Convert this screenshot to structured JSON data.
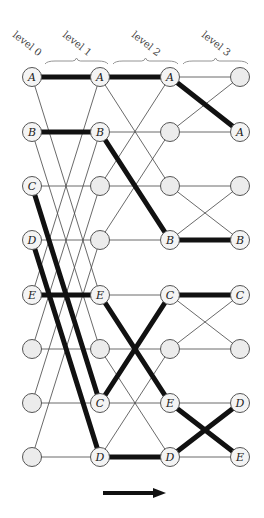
{
  "diagram": {
    "type": "butterfly-network",
    "levels": [
      {
        "label": "level 0",
        "x": 32
      },
      {
        "label": "level 1",
        "x": 100
      },
      {
        "label": "level 2",
        "x": 170
      },
      {
        "label": "level 3",
        "x": 240
      }
    ],
    "rows_y": [
      77,
      132,
      186,
      240,
      295,
      349,
      403,
      457
    ],
    "strides": [
      4,
      2,
      1
    ],
    "node_labels": [
      [
        "A",
        "B",
        "C",
        "D",
        "E",
        "",
        "",
        ""
      ],
      [
        "A",
        "B",
        "",
        "",
        "E",
        "",
        "C",
        "D"
      ],
      [
        "A",
        "",
        "",
        "B",
        "C",
        "",
        "E",
        "D"
      ],
      [
        "",
        "A",
        "",
        "B",
        "C",
        "",
        "D",
        "E"
      ]
    ],
    "routes": [
      {
        "name": "A",
        "rows": [
          0,
          0,
          0,
          1
        ]
      },
      {
        "name": "B",
        "rows": [
          1,
          1,
          3,
          3
        ]
      },
      {
        "name": "C",
        "rows": [
          2,
          6,
          4,
          4
        ]
      },
      {
        "name": "D",
        "rows": [
          3,
          7,
          7,
          6
        ]
      },
      {
        "name": "E",
        "rows": [
          4,
          4,
          6,
          7
        ]
      }
    ],
    "colors": {
      "node_fill_labeled": "#f4f4f4",
      "node_fill_empty": "#ececec",
      "thick_route": "#111111",
      "thin_edge": "#444444"
    },
    "arrow": {
      "direction": "right",
      "x1": 103,
      "x2": 166,
      "y": 493
    }
  }
}
